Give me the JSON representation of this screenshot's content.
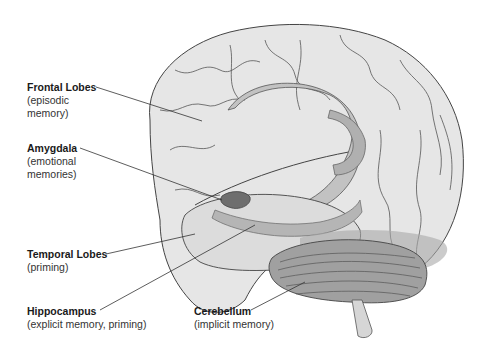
{
  "diagram": {
    "colors": {
      "cortex_fill": "#e4e4e4",
      "cortex_line": "#444444",
      "limbic_fill": "#b8b8b8",
      "amygdala_fill": "#6e6e6e",
      "cerebellum_fill": "#9a9a9a",
      "leader_line": "#333333"
    },
    "labels": [
      {
        "id": "frontal",
        "title": "Frontal Lobes",
        "desc_lines": [
          "(episodic",
          "memory)"
        ]
      },
      {
        "id": "amygdala",
        "title": "Amygdala",
        "desc_lines": [
          "(emotional",
          "memories)"
        ]
      },
      {
        "id": "temporal",
        "title": "Temporal Lobes",
        "desc_lines": [
          "(priming)"
        ]
      },
      {
        "id": "hippocampus",
        "title": "Hippocampus",
        "desc_lines": [
          "(explicit memory, priming)"
        ]
      },
      {
        "id": "cerebellum",
        "title": "Cerebellum",
        "desc_lines": [
          "(implicit memory)"
        ]
      }
    ]
  }
}
